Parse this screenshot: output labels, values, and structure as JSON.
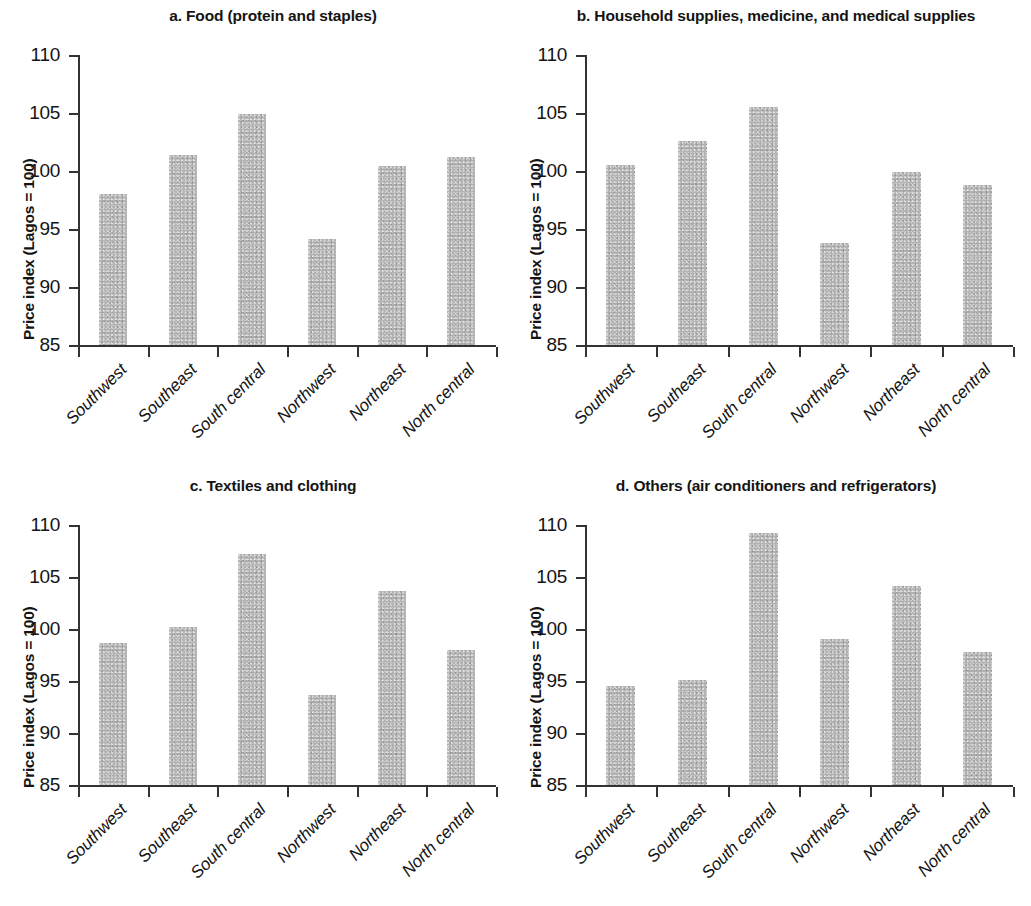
{
  "figure": {
    "axis": {
      "ylabel": "Price index (Lagos = 100)",
      "yticks": [
        "110",
        "105",
        "100",
        "95",
        "90",
        "85"
      ],
      "ymin": 85,
      "ymax": 110
    },
    "categories": [
      "Southwest",
      "Southeast",
      "South central",
      "Northwest",
      "Northeast",
      "North central"
    ]
  },
  "chart_data": [
    {
      "type": "bar",
      "panel": "a",
      "title": "a. Food (protein and staples)",
      "categories": [
        "Southwest",
        "Southeast",
        "South central",
        "Northwest",
        "Northeast",
        "North central"
      ],
      "values": [
        98.0,
        101.4,
        104.9,
        94.1,
        100.4,
        101.2
      ],
      "xlabel": "",
      "ylabel": "Price index (Lagos = 100)",
      "ylim": [
        85,
        110
      ],
      "yticks": [
        85,
        90,
        95,
        100,
        105,
        110
      ],
      "grid": false,
      "legend": "none",
      "bar_color": "#b3b3b3"
    },
    {
      "type": "bar",
      "panel": "b",
      "title": "b. Household supplies, medicine, and medical supplies",
      "categories": [
        "Southwest",
        "Southeast",
        "South central",
        "Northwest",
        "Northeast",
        "North central"
      ],
      "values": [
        100.5,
        102.6,
        105.5,
        93.8,
        99.9,
        98.8
      ],
      "xlabel": "",
      "ylabel": "Price index (Lagos = 100)",
      "ylim": [
        85,
        110
      ],
      "yticks": [
        85,
        90,
        95,
        100,
        105,
        110
      ],
      "grid": false,
      "legend": "none",
      "bar_color": "#b3b3b3"
    },
    {
      "type": "bar",
      "panel": "c",
      "title": "c. Textiles and clothing",
      "categories": [
        "Southwest",
        "Southeast",
        "South central",
        "Northwest",
        "Northeast",
        "North central"
      ],
      "values": [
        98.7,
        100.2,
        107.2,
        93.7,
        103.7,
        98.0
      ],
      "xlabel": "",
      "ylabel": "Price index (Lagos = 100)",
      "ylim": [
        85,
        110
      ],
      "yticks": [
        85,
        90,
        95,
        100,
        105,
        110
      ],
      "grid": false,
      "legend": "none",
      "bar_color": "#b3b3b3"
    },
    {
      "type": "bar",
      "panel": "d",
      "title": "d. Others (air conditioners and refrigerators)",
      "categories": [
        "Southwest",
        "Southeast",
        "South central",
        "Northwest",
        "Northeast",
        "North central"
      ],
      "values": [
        94.5,
        95.1,
        109.2,
        99.0,
        104.1,
        97.8
      ],
      "xlabel": "",
      "ylabel": "Price index (Lagos = 100)",
      "ylim": [
        85,
        110
      ],
      "yticks": [
        85,
        90,
        95,
        100,
        105,
        110
      ],
      "grid": false,
      "legend": "none",
      "bar_color": "#b3b3b3"
    }
  ]
}
